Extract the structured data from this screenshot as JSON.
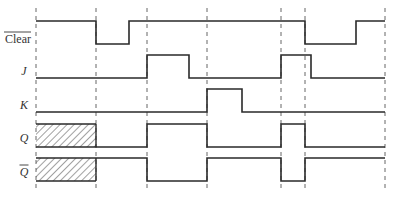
{
  "diagram": {
    "type": "timing-diagram",
    "time_markers_x": [
      36,
      96,
      147,
      207,
      281,
      305,
      385
    ],
    "signals": [
      {
        "name": "Clear",
        "overline": true,
        "label_y": 43,
        "high_y": 21,
        "low_y": 44,
        "segments": [
          [
            36,
            96,
            "H"
          ],
          [
            96,
            129,
            "L"
          ],
          [
            129,
            305,
            "H"
          ],
          [
            305,
            356,
            "L"
          ],
          [
            356,
            385,
            "H"
          ]
        ]
      },
      {
        "name": "J",
        "overline": false,
        "label_y": 75,
        "high_y": 55,
        "low_y": 78,
        "segments": [
          [
            36,
            147,
            "L"
          ],
          [
            147,
            189,
            "H"
          ],
          [
            189,
            281,
            "L"
          ],
          [
            281,
            311,
            "H"
          ],
          [
            311,
            385,
            "L"
          ]
        ]
      },
      {
        "name": "K",
        "overline": false,
        "label_y": 109,
        "high_y": 89,
        "low_y": 112,
        "segments": [
          [
            36,
            207,
            "L"
          ],
          [
            207,
            242,
            "H"
          ],
          [
            242,
            385,
            "L"
          ]
        ]
      },
      {
        "name": "Q",
        "overline": false,
        "label_y": 142,
        "high_y": 124,
        "low_y": 147,
        "segments": [
          [
            36,
            96,
            "X"
          ],
          [
            96,
            147,
            "L"
          ],
          [
            147,
            207,
            "H"
          ],
          [
            207,
            281,
            "L"
          ],
          [
            281,
            305,
            "H"
          ],
          [
            305,
            385,
            "L"
          ]
        ]
      },
      {
        "name": "Q",
        "overline": true,
        "label_y": 176,
        "high_y": 158,
        "low_y": 181,
        "segments": [
          [
            36,
            96,
            "X"
          ],
          [
            96,
            147,
            "H"
          ],
          [
            147,
            207,
            "L"
          ],
          [
            207,
            281,
            "H"
          ],
          [
            281,
            305,
            "L"
          ],
          [
            305,
            385,
            "H"
          ]
        ]
      }
    ],
    "colors": {
      "line": "#2a2a2a",
      "dash": "#555555",
      "background": "#ffffff"
    }
  }
}
